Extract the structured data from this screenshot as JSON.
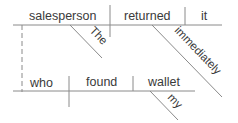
{
  "diagram": {
    "type": "Reed-Kellogg sentence diagram",
    "main_clause": {
      "subject": "salesperson",
      "verb": "returned",
      "direct_object": "it",
      "subject_modifiers": [
        "The"
      ],
      "verb_modifiers": [
        "immediately"
      ]
    },
    "relative_clause": {
      "subject": "who",
      "verb": "found",
      "direct_object": "wallet",
      "object_modifiers": [
        "my"
      ]
    },
    "words": {
      "salesperson": "salesperson",
      "returned": "returned",
      "it": "it",
      "the": "The",
      "immediately": "immediately",
      "who": "who",
      "found": "found",
      "wallet": "wallet",
      "my": "my"
    }
  }
}
